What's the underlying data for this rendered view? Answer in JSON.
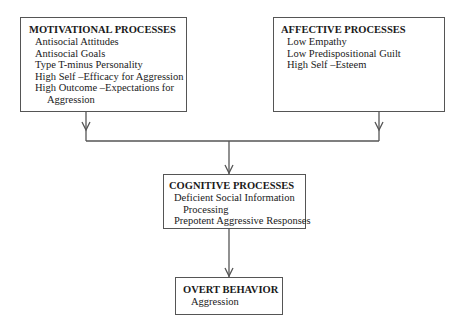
{
  "diagram": {
    "boxes": {
      "motivational": {
        "title": "MOTIVATIONAL PROCESSES",
        "items": [
          "Antisocial Attitudes",
          "Antisocial Goals",
          "Type T-minus Personality",
          "High Self –Efficacy for Aggression",
          "High Outcome –Expectations for",
          "Aggression"
        ]
      },
      "affective": {
        "title": "AFFECTIVE PROCESSES",
        "items": [
          "Low Empathy",
          "Low Predispositional Guilt",
          "High Self –Esteem"
        ]
      },
      "cognitive": {
        "title": "COGNITIVE PROCESSES",
        "items": [
          "Deficient Social Information",
          "Processing",
          "Prepotent Aggressive Responses"
        ]
      },
      "overt": {
        "title": "OVERT BEHAVIOR",
        "items": [
          "Aggression"
        ]
      }
    },
    "edges": [
      {
        "from": "motivational",
        "to": "cognitive"
      },
      {
        "from": "affective",
        "to": "cognitive"
      },
      {
        "from": "cognitive",
        "to": "overt"
      }
    ],
    "colors": {
      "line": "#555555",
      "text": "#1a1a1a",
      "background": "#ffffff"
    }
  }
}
